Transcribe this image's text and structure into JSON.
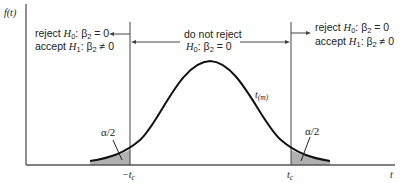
{
  "figure": {
    "y_axis_label": "f(t)",
    "x_axis_label": "t",
    "curve_label": {
      "base": "t",
      "subscript": "(m)"
    },
    "left_region": {
      "line1": {
        "prefix": "reject ",
        "h": "H",
        "hsub": "0",
        "rest": ": β",
        "bsub": "2",
        "tail": " = 0"
      },
      "line2": {
        "prefix": "accept ",
        "h": "H",
        "hsub": "1",
        "rest": ": β",
        "bsub": "2",
        "tail": " ≠ 0"
      }
    },
    "middle_region": {
      "line1": "do not reject",
      "line2": {
        "h": "H",
        "hsub": "0",
        "rest": ": β",
        "bsub": "2",
        "tail": " = 0"
      }
    },
    "right_region": {
      "line1": {
        "prefix": "reject ",
        "h": "H",
        "hsub": "0",
        "rest": ": β",
        "bsub": "2",
        "tail": " = 0"
      },
      "line2": {
        "prefix": "accept ",
        "h": "H",
        "hsub": "1",
        "rest": ": β",
        "bsub": "2",
        "tail": " ≠ 0"
      }
    },
    "left_tail_label": "α/2",
    "right_tail_label": "α/2",
    "left_critical": {
      "sign": "−",
      "base": "t",
      "subscript": "c"
    },
    "right_critical": {
      "base": "t",
      "subscript": "c"
    },
    "colors": {
      "line": "#222222",
      "axis": "#555555",
      "shade": "#b0b0b0",
      "curve": "#111111"
    }
  }
}
